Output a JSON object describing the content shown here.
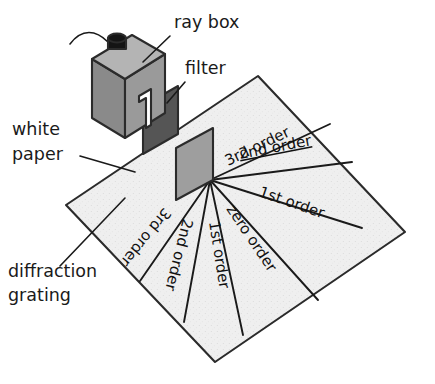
{
  "figure": {
    "background_color": "#ffffff"
  },
  "colors": {
    "paper_fill": "#efefef",
    "paper_edge": "#2b2b2b",
    "ray_box_front": "#9a9a9a",
    "ray_box_side": "#8a8a8a",
    "ray_box_top": "#b4b4b4",
    "knob": "#141414",
    "filter_fill": "#555555",
    "grating_fill": "#9e9e9e",
    "ink": "#1a1a1a"
  },
  "labels": [
    {
      "id": "ray-box",
      "text": "ray box",
      "x": 174,
      "y": 28,
      "anchor": "start"
    },
    {
      "id": "filter",
      "text": "filter",
      "x": 185,
      "y": 74,
      "anchor": "start"
    },
    {
      "id": "white-paper-line1",
      "text": "white",
      "x": 12,
      "y": 135,
      "anchor": "start"
    },
    {
      "id": "white-paper-line2",
      "text": "paper",
      "x": 12,
      "y": 160,
      "anchor": "start"
    },
    {
      "id": "diffraction-line1",
      "text": "diffraction",
      "x": 8,
      "y": 277,
      "anchor": "start"
    },
    {
      "id": "diffraction-line2",
      "text": "grating",
      "x": 8,
      "y": 301,
      "anchor": "start"
    }
  ],
  "leader_lines": [
    {
      "id": "ray-box-leader",
      "path": "M 170 36 L 143 62"
    },
    {
      "id": "filter-leader",
      "path": "M 185 82 L 167 103"
    },
    {
      "id": "white-paper-leader",
      "path": "M 80 156 L 135 172"
    },
    {
      "id": "diffraction-grating-leader",
      "path": "M 60 266 L 125 198"
    }
  ],
  "paper": {
    "name": "white-paper-sheet",
    "corners": [
      [
        258,
        76
      ],
      [
        405,
        232
      ],
      [
        215,
        362
      ],
      [
        66,
        205
      ]
    ]
  },
  "grating": {
    "name": "diffraction-grating",
    "points": [
      [
        176,
        148
      ],
      [
        213,
        128
      ],
      [
        213,
        180
      ],
      [
        176,
        200
      ]
    ]
  },
  "filter": {
    "name": "colour-filter",
    "points": [
      [
        143,
        106
      ],
      [
        178,
        86
      ],
      [
        178,
        134
      ],
      [
        143,
        154
      ]
    ]
  },
  "ray_box": {
    "name": "ray-box",
    "top_face": [
      [
        92,
        59
      ],
      [
        132,
        35
      ],
      [
        165,
        54
      ],
      [
        125,
        79
      ]
    ],
    "left_face": [
      [
        92,
        59
      ],
      [
        125,
        79
      ],
      [
        125,
        138
      ],
      [
        92,
        118
      ]
    ],
    "right_face": [
      [
        125,
        79
      ],
      [
        165,
        54
      ],
      [
        165,
        113
      ],
      [
        125,
        138
      ]
    ],
    "slit": [
      [
        139,
        96
      ],
      [
        151,
        89
      ],
      [
        151,
        125
      ],
      [
        146,
        128
      ],
      [
        146,
        98
      ],
      [
        139,
        102
      ]
    ],
    "knob_cap": {
      "cx": 117,
      "cy": 38,
      "rx": 9,
      "ry": 4.5
    },
    "knob_body": [
      [
        108,
        38
      ],
      [
        126,
        38
      ],
      [
        126,
        49
      ],
      [
        108,
        49
      ]
    ],
    "cable_path": "M 108 42 C 96 30 82 28 70 44"
  },
  "diffraction_origin": {
    "x": 210,
    "y": 180
  },
  "rays": [
    {
      "id": "ray-3rd-order-upper",
      "label": "3rd order",
      "end_x": 330,
      "end_y": 124,
      "label_x": 228,
      "label_y": 166,
      "rotate": -26,
      "underline": false
    },
    {
      "id": "ray-2nd-order-upper",
      "label": "2nd order",
      "end_x": 352,
      "end_y": 162,
      "label_x": 240,
      "label_y": 159,
      "rotate": -11,
      "underline": true
    },
    {
      "id": "ray-1st-order-upper",
      "label": "1st order",
      "end_x": 362,
      "end_y": 228,
      "label_x": 258,
      "label_y": 196,
      "rotate": 19,
      "underline": false
    },
    {
      "id": "ray-zero-order",
      "label": "zero order",
      "end_x": 318,
      "end_y": 300,
      "label_x": 226,
      "label_y": 209,
      "rotate": 56,
      "underline": false
    },
    {
      "id": "ray-1st-order-lower",
      "label": "1st order",
      "end_x": 243,
      "end_y": 335,
      "label_x": 209,
      "label_y": 222,
      "rotate": 81,
      "underline": false
    },
    {
      "id": "ray-2nd-order-lower",
      "label": "2nd order",
      "end_x": 184,
      "end_y": 322,
      "label_x": 183,
      "label_y": 218,
      "rotate": 104,
      "underline": false
    },
    {
      "id": "ray-3rd-order-lower",
      "label": "3rd order",
      "end_x": 140,
      "end_y": 281,
      "label_x": 164,
      "label_y": 207,
      "rotate": 129,
      "underline": false
    }
  ]
}
